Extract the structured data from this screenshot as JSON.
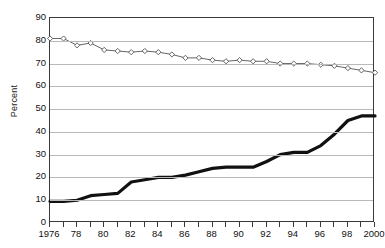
{
  "chart_data": {
    "type": "line",
    "title": "",
    "xlabel": "",
    "ylabel": "Percent",
    "ylim": [
      0,
      90
    ],
    "ytick_step": 10,
    "yticks": [
      0,
      10,
      20,
      30,
      40,
      50,
      60,
      70,
      80,
      90
    ],
    "ytick_labels": [
      "0",
      "10",
      "20",
      "30",
      "40",
      "50",
      "60",
      "70",
      "80",
      "90"
    ],
    "xlim": [
      1976,
      2000
    ],
    "x": [
      1976,
      1977,
      1978,
      1979,
      1980,
      1981,
      1982,
      1983,
      1984,
      1985,
      1986,
      1987,
      1988,
      1989,
      1990,
      1991,
      1992,
      1993,
      1994,
      1995,
      1996,
      1997,
      1998,
      1999,
      2000
    ],
    "xtick_values": [
      1976,
      1978,
      1980,
      1982,
      1984,
      1986,
      1988,
      1990,
      1992,
      1994,
      1996,
      1998,
      2000
    ],
    "xtick_labels": [
      "1976",
      "78",
      "80",
      "82",
      "84",
      "86",
      "88",
      "90",
      "92",
      "94",
      "96",
      "98",
      "2000"
    ],
    "xtick_all_years": true,
    "grid": true,
    "grid_axis": "y",
    "legend": "none",
    "series": [
      {
        "name": "upper-series",
        "marker": "diamond",
        "style": "thin-line-with-markers",
        "color": "#555555",
        "values": [
          81,
          81,
          78,
          79,
          76,
          75.5,
          75,
          75.5,
          75,
          74,
          72.5,
          72.5,
          71.5,
          71,
          71.5,
          71,
          71,
          70,
          70,
          70,
          69.5,
          69,
          68,
          67,
          66
        ]
      },
      {
        "name": "lower-series",
        "marker": "none",
        "style": "thick-line",
        "color": "#111111",
        "values": [
          9.5,
          9.5,
          10,
          12,
          12.5,
          13,
          18,
          19,
          20,
          20,
          21,
          22.5,
          24,
          24.5,
          24.5,
          24.5,
          27,
          30,
          31,
          31,
          34,
          39,
          45,
          47,
          47
        ]
      }
    ]
  },
  "axes": {
    "y_title": "Percent"
  }
}
